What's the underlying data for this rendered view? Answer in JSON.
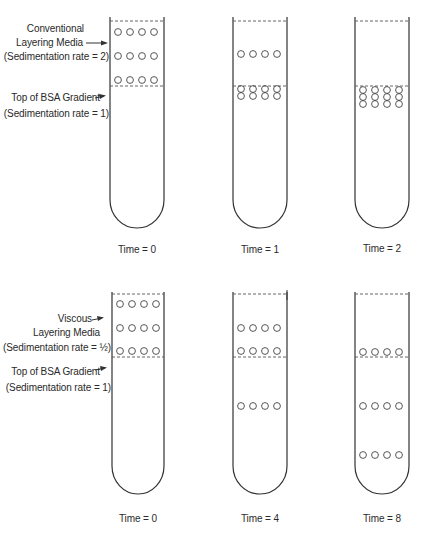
{
  "top_panel": {
    "labels": {
      "media_line1": "Conventional",
      "media_line2": "Layering Media",
      "media_rate": "(Sedimentation rate = 2)",
      "gradient_line1": "Top of BSA Gradient",
      "gradient_rate": "(Sedimentation rate = 1)"
    },
    "tubes": [
      {
        "time_label": "Time = 0"
      },
      {
        "time_label": "Time = 1"
      },
      {
        "time_label": "Time = 2"
      }
    ]
  },
  "bottom_panel": {
    "labels": {
      "media_line1": "Viscous",
      "media_line2": "Layering Media",
      "media_rate": "(Sedimentation rate = ½)",
      "gradient_line1": "Top of BSA Gradient",
      "gradient_rate": "(Sedimentation rate = 1)"
    },
    "tubes": [
      {
        "time_label": "Time = 0"
      },
      {
        "time_label": "Time = 4"
      },
      {
        "time_label": "Time = 8"
      }
    ]
  },
  "colors": {
    "line": "#333333",
    "dash": "#555555"
  }
}
